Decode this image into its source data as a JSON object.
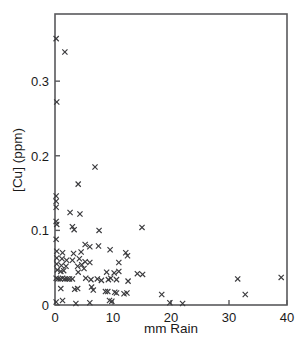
{
  "chart_data": {
    "type": "scatter",
    "title": "",
    "xlabel": "mm Rain",
    "ylabel": "[Cu] (ppm)",
    "xlim": [
      0,
      40
    ],
    "ylim": [
      0,
      0.39
    ],
    "grid": false,
    "legend": null,
    "marker": "x",
    "marker_color": "#3a3a3d",
    "frame_color": "#59595c",
    "xticks": [
      0,
      10,
      20,
      30,
      40
    ],
    "xtick_labels": [
      "0",
      "10",
      "20",
      "30",
      "40"
    ],
    "yticks": [
      0,
      0.1,
      0.2,
      0.3
    ],
    "ytick_labels": [
      "0",
      "0.1",
      "0.2",
      "0.3"
    ],
    "series": [
      {
        "name": "samples",
        "points": [
          [
            0.2,
            0.357
          ],
          [
            1.7,
            0.339
          ],
          [
            0.3,
            0.272
          ],
          [
            6.9,
            0.185
          ],
          [
            4.0,
            0.162
          ],
          [
            0.2,
            0.146
          ],
          [
            0.2,
            0.139
          ],
          [
            0.2,
            0.131
          ],
          [
            2.6,
            0.124
          ],
          [
            4.3,
            0.122
          ],
          [
            0.2,
            0.112
          ],
          [
            0.3,
            0.108
          ],
          [
            3.0,
            0.105
          ],
          [
            3.3,
            0.101
          ],
          [
            7.6,
            0.1
          ],
          [
            15.0,
            0.104
          ],
          [
            0.2,
            0.088
          ],
          [
            5.2,
            0.081
          ],
          [
            6.0,
            0.078
          ],
          [
            7.5,
            0.079
          ],
          [
            0.3,
            0.072
          ],
          [
            1.3,
            0.07
          ],
          [
            3.2,
            0.069
          ],
          [
            4.5,
            0.071
          ],
          [
            9.5,
            0.074
          ],
          [
            12.2,
            0.07
          ],
          [
            12.5,
            0.066
          ],
          [
            0.3,
            0.063
          ],
          [
            1.2,
            0.062
          ],
          [
            2.0,
            0.06
          ],
          [
            3.0,
            0.06
          ],
          [
            4.2,
            0.062
          ],
          [
            5.2,
            0.058
          ],
          [
            6.0,
            0.057
          ],
          [
            11.0,
            0.057
          ],
          [
            0.3,
            0.055
          ],
          [
            1.1,
            0.053
          ],
          [
            1.9,
            0.052
          ],
          [
            3.9,
            0.052
          ],
          [
            4.6,
            0.054
          ],
          [
            5.0,
            0.049
          ],
          [
            0.4,
            0.047
          ],
          [
            1.0,
            0.045
          ],
          [
            1.5,
            0.046
          ],
          [
            4.0,
            0.044
          ],
          [
            8.9,
            0.044
          ],
          [
            10.2,
            0.043
          ],
          [
            11.0,
            0.045
          ],
          [
            14.2,
            0.042
          ],
          [
            15.1,
            0.041
          ],
          [
            0.2,
            0.036
          ],
          [
            0.5,
            0.035
          ],
          [
            0.9,
            0.035
          ],
          [
            1.3,
            0.036
          ],
          [
            1.7,
            0.035
          ],
          [
            2.1,
            0.035
          ],
          [
            2.5,
            0.035
          ],
          [
            3.0,
            0.035
          ],
          [
            5.3,
            0.036
          ],
          [
            6.2,
            0.034
          ],
          [
            7.3,
            0.035
          ],
          [
            8.0,
            0.033
          ],
          [
            9.2,
            0.034
          ],
          [
            9.6,
            0.036
          ],
          [
            10.6,
            0.034
          ],
          [
            12.6,
            0.032
          ],
          [
            31.5,
            0.035
          ],
          [
            39.0,
            0.037
          ],
          [
            1.0,
            0.022
          ],
          [
            3.4,
            0.021
          ],
          [
            3.9,
            0.022
          ],
          [
            6.3,
            0.024
          ],
          [
            6.6,
            0.02
          ],
          [
            8.7,
            0.018
          ],
          [
            9.1,
            0.018
          ],
          [
            10.3,
            0.017
          ],
          [
            10.6,
            0.016
          ],
          [
            11.9,
            0.015
          ],
          [
            12.4,
            0.016
          ],
          [
            18.4,
            0.014
          ],
          [
            32.8,
            0.014
          ],
          [
            0.2,
            0.004
          ],
          [
            1.3,
            0.006
          ],
          [
            3.6,
            0.002
          ],
          [
            6.0,
            0.003
          ],
          [
            9.4,
            0.006
          ],
          [
            9.8,
            0.005
          ],
          [
            19.8,
            0.003
          ],
          [
            22.0,
            0.002
          ]
        ]
      }
    ]
  },
  "axes": {
    "x_title": "mm Rain",
    "y_title": "[Cu] (ppm)"
  }
}
